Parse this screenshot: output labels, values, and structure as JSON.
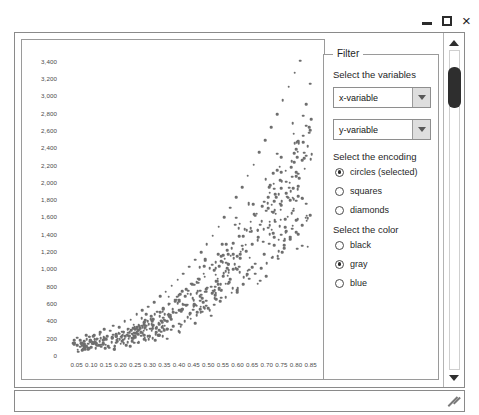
{
  "window": {
    "controls": [
      {
        "name": "minimize-button",
        "label": "–"
      },
      {
        "name": "maximize-button",
        "label": "□"
      },
      {
        "name": "close-button",
        "label": "×"
      }
    ]
  },
  "filter": {
    "legend": "Filter",
    "variables_label": "Select the variables",
    "encoding_label": "Select the encoding",
    "color_label": "Select the color",
    "dropdowns": [
      {
        "name": "x-variable-select",
        "value": "x-variable"
      },
      {
        "name": "y-variable-select",
        "value": "y-variable"
      }
    ],
    "encoding_options": [
      {
        "label": "circles (selected)",
        "selected": true
      },
      {
        "label": "squares",
        "selected": false
      },
      {
        "label": "diamonds",
        "selected": false
      }
    ],
    "color_options": [
      {
        "label": "black",
        "selected": false
      },
      {
        "label": "gray",
        "selected": true
      },
      {
        "label": "blue",
        "selected": false
      }
    ]
  },
  "scrollbar": {
    "up_arrow": "▲",
    "down_arrow": "▼",
    "thumb_position_pct": 6
  },
  "chart_data": {
    "type": "scatter",
    "title": "",
    "xlabel": "",
    "ylabel": "",
    "grid": false,
    "legend": null,
    "marker": {
      "shape": "circle",
      "color": "#6e6e6e",
      "size": 2.6
    },
    "xlim": [
      0.0,
      0.875
    ],
    "ylim": [
      0,
      3500
    ],
    "xticks": [
      0.05,
      0.1,
      0.15,
      0.2,
      0.25,
      0.3,
      0.35,
      0.4,
      0.45,
      0.5,
      0.55,
      0.6,
      0.65,
      0.7,
      0.75,
      0.8,
      0.85
    ],
    "xticklabels": [
      "0.05",
      "0.10",
      "0.15",
      "0.20",
      "0.25",
      "0.30",
      "0.35",
      "0.40",
      "0.45",
      "0.50",
      "0.55",
      "0.60",
      "0.65",
      "0.70",
      "0.75",
      "0.80",
      "0.85"
    ],
    "yticks": [
      0,
      200,
      400,
      600,
      800,
      1000,
      1200,
      1400,
      1600,
      1800,
      2000,
      2200,
      2400,
      2600,
      2800,
      3000,
      3200,
      3400
    ],
    "yticklabels": [
      "0",
      "200",
      "400",
      "600",
      "800",
      "1,000",
      "1,200",
      "1,400",
      "1,600",
      "1,800",
      "2,000",
      "2,200",
      "2,400",
      "2,600",
      "2,800",
      "3,000",
      "3,200",
      "3,400"
    ],
    "n_points": 640,
    "points": [
      [
        0.055,
        40
      ],
      [
        0.062,
        95
      ],
      [
        0.07,
        55
      ],
      [
        0.075,
        130
      ],
      [
        0.08,
        70
      ],
      [
        0.085,
        180
      ],
      [
        0.09,
        60
      ],
      [
        0.095,
        210
      ],
      [
        0.1,
        90
      ],
      [
        0.105,
        150
      ],
      [
        0.11,
        230
      ],
      [
        0.115,
        80
      ],
      [
        0.12,
        190
      ],
      [
        0.125,
        110
      ],
      [
        0.13,
        260
      ],
      [
        0.135,
        95
      ],
      [
        0.14,
        170
      ],
      [
        0.145,
        300
      ],
      [
        0.15,
        120
      ],
      [
        0.155,
        220
      ],
      [
        0.16,
        85
      ],
      [
        0.165,
        280
      ],
      [
        0.17,
        150
      ],
      [
        0.175,
        340
      ],
      [
        0.18,
        100
      ],
      [
        0.185,
        240
      ],
      [
        0.19,
        190
      ],
      [
        0.195,
        320
      ],
      [
        0.2,
        130
      ],
      [
        0.205,
        270
      ],
      [
        0.21,
        175
      ],
      [
        0.215,
        390
      ],
      [
        0.22,
        115
      ],
      [
        0.225,
        300
      ],
      [
        0.23,
        220
      ],
      [
        0.235,
        410
      ],
      [
        0.24,
        160
      ],
      [
        0.245,
        350
      ],
      [
        0.25,
        200
      ],
      [
        0.255,
        470
      ],
      [
        0.26,
        140
      ],
      [
        0.265,
        330
      ],
      [
        0.27,
        260
      ],
      [
        0.275,
        520
      ],
      [
        0.28,
        185
      ],
      [
        0.285,
        400
      ],
      [
        0.29,
        290
      ],
      [
        0.295,
        560
      ],
      [
        0.3,
        210
      ],
      [
        0.305,
        450
      ],
      [
        0.31,
        330
      ],
      [
        0.315,
        610
      ],
      [
        0.32,
        240
      ],
      [
        0.325,
        500
      ],
      [
        0.33,
        370
      ],
      [
        0.335,
        680
      ],
      [
        0.34,
        270
      ],
      [
        0.345,
        540
      ],
      [
        0.35,
        410
      ],
      [
        0.355,
        730
      ],
      [
        0.36,
        300
      ],
      [
        0.365,
        590
      ],
      [
        0.37,
        450
      ],
      [
        0.375,
        800
      ],
      [
        0.38,
        330
      ],
      [
        0.385,
        640
      ],
      [
        0.39,
        490
      ],
      [
        0.395,
        870
      ],
      [
        0.4,
        360
      ],
      [
        0.405,
        700
      ],
      [
        0.41,
        530
      ],
      [
        0.415,
        940
      ],
      [
        0.42,
        390
      ],
      [
        0.425,
        760
      ],
      [
        0.43,
        580
      ],
      [
        0.435,
        1020
      ],
      [
        0.44,
        420
      ],
      [
        0.445,
        820
      ],
      [
        0.45,
        630
      ],
      [
        0.455,
        1100
      ],
      [
        0.46,
        460
      ],
      [
        0.465,
        880
      ],
      [
        0.47,
        680
      ],
      [
        0.475,
        1190
      ],
      [
        0.48,
        500
      ],
      [
        0.485,
        940
      ],
      [
        0.49,
        730
      ],
      [
        0.495,
        1280
      ],
      [
        0.5,
        540
      ],
      [
        0.505,
        1000
      ],
      [
        0.51,
        790
      ],
      [
        0.515,
        1380
      ],
      [
        0.52,
        580
      ],
      [
        0.525,
        1070
      ],
      [
        0.53,
        850
      ],
      [
        0.535,
        1480
      ],
      [
        0.54,
        620
      ],
      [
        0.545,
        1140
      ],
      [
        0.55,
        910
      ],
      [
        0.555,
        1590
      ],
      [
        0.56,
        670
      ],
      [
        0.565,
        1210
      ],
      [
        0.57,
        980
      ],
      [
        0.575,
        1700
      ],
      [
        0.58,
        720
      ],
      [
        0.585,
        1290
      ],
      [
        0.59,
        1050
      ],
      [
        0.595,
        1820
      ],
      [
        0.6,
        770
      ],
      [
        0.605,
        1370
      ],
      [
        0.61,
        1120
      ],
      [
        0.615,
        1940
      ],
      [
        0.62,
        820
      ],
      [
        0.625,
        1450
      ],
      [
        0.63,
        1200
      ],
      [
        0.635,
        2070
      ],
      [
        0.64,
        880
      ],
      [
        0.645,
        1540
      ],
      [
        0.65,
        1280
      ],
      [
        0.655,
        2200
      ],
      [
        0.66,
        940
      ],
      [
        0.665,
        1630
      ],
      [
        0.67,
        1360
      ],
      [
        0.675,
        2340
      ],
      [
        0.68,
        1000
      ],
      [
        0.685,
        1720
      ],
      [
        0.69,
        1450
      ],
      [
        0.695,
        2480
      ],
      [
        0.7,
        1060
      ],
      [
        0.705,
        1820
      ],
      [
        0.71,
        1540
      ],
      [
        0.715,
        2630
      ],
      [
        0.72,
        1130
      ],
      [
        0.725,
        1920
      ],
      [
        0.73,
        1630
      ],
      [
        0.735,
        2780
      ],
      [
        0.74,
        1200
      ],
      [
        0.745,
        2020
      ],
      [
        0.75,
        1730
      ],
      [
        0.755,
        2940
      ],
      [
        0.76,
        1270
      ],
      [
        0.765,
        2130
      ],
      [
        0.77,
        1830
      ],
      [
        0.775,
        3100
      ],
      [
        0.78,
        1340
      ],
      [
        0.785,
        2240
      ],
      [
        0.79,
        1930
      ],
      [
        0.795,
        3260
      ],
      [
        0.8,
        1420
      ],
      [
        0.805,
        2350
      ],
      [
        0.81,
        2040
      ],
      [
        0.815,
        3400
      ],
      [
        0.82,
        1500
      ],
      [
        0.825,
        2460
      ],
      [
        0.83,
        2150
      ],
      [
        0.835,
        2900
      ],
      [
        0.84,
        1580
      ],
      [
        0.845,
        2570
      ],
      [
        0.85,
        2260
      ]
    ]
  }
}
